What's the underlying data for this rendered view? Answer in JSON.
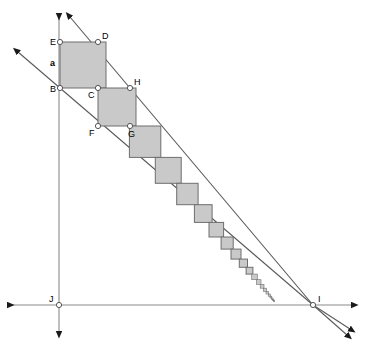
{
  "figure": {
    "canvas": {
      "width": 366,
      "height": 352
    },
    "colors": {
      "background": "#ffffff",
      "square_fill": "#c9c9c9",
      "square_stroke": "#6e6e6e",
      "line_stroke": "#5a5a5a",
      "axis_stroke": "#8a8a8a",
      "label_color": "#000000",
      "vertex_fill": "#ffffff",
      "vertex_stroke": "#555555"
    },
    "labels": {
      "a": "a",
      "B": "B",
      "C": "C",
      "D": "D",
      "E": "E",
      "F": "F",
      "G": "G",
      "H": "H",
      "I": "I",
      "J": "J"
    },
    "points": [
      {
        "name": "E",
        "x": 60,
        "y": 42,
        "label_dx": -10,
        "label_dy": 3
      },
      {
        "name": "D",
        "x": 98,
        "y": 42,
        "label_dx": 4,
        "label_dy": -3
      },
      {
        "name": "B",
        "x": 60,
        "y": 88,
        "label_dx": -10,
        "label_dy": 4
      },
      {
        "name": "C",
        "x": 98,
        "y": 88,
        "label_dx": -10,
        "label_dy": 10
      },
      {
        "name": "H",
        "x": 130,
        "y": 88,
        "label_dx": 4,
        "label_dy": -3
      },
      {
        "name": "F",
        "x": 98,
        "y": 126,
        "label_dx": -9,
        "label_dy": 10
      },
      {
        "name": "G",
        "x": 130,
        "y": 126,
        "label_dx": -2,
        "label_dy": 11
      },
      {
        "name": "J",
        "x": 59,
        "y": 305,
        "label_dx": -10,
        "label_dy": -3
      },
      {
        "name": "I",
        "x": 313,
        "y": 305,
        "label_dx": 5,
        "label_dy": -3
      }
    ],
    "squares": [
      {
        "x": 60.0,
        "y": 42.0,
        "size": 46.0
      },
      {
        "x": 98.0,
        "y": 88.0,
        "size": 38.0
      },
      {
        "x": 129.4,
        "y": 126.0,
        "size": 31.4
      },
      {
        "x": 155.3,
        "y": 157.4,
        "size": 25.9
      },
      {
        "x": 176.7,
        "y": 183.3,
        "size": 21.4
      },
      {
        "x": 194.4,
        "y": 204.7,
        "size": 17.7
      },
      {
        "x": 209.0,
        "y": 222.4,
        "size": 14.6
      },
      {
        "x": 221.1,
        "y": 237.0,
        "size": 12.1
      },
      {
        "x": 231.0,
        "y": 249.1,
        "size": 10.0
      },
      {
        "x": 239.3,
        "y": 259.1,
        "size": 8.2
      },
      {
        "x": 246.1,
        "y": 267.3,
        "size": 6.8
      },
      {
        "x": 251.7,
        "y": 274.1,
        "size": 5.6
      },
      {
        "x": 256.4,
        "y": 279.7,
        "size": 4.6
      },
      {
        "x": 260.2,
        "y": 284.4,
        "size": 3.8
      },
      {
        "x": 263.4,
        "y": 288.2,
        "size": 3.2
      },
      {
        "x": 266.0,
        "y": 291.4,
        "size": 2.6
      },
      {
        "x": 268.2,
        "y": 294.0,
        "size": 2.2
      },
      {
        "x": 270.0,
        "y": 296.2,
        "size": 1.8
      },
      {
        "x": 271.5,
        "y": 298.0,
        "size": 1.5
      },
      {
        "x": 272.7,
        "y": 299.5,
        "size": 1.2
      },
      {
        "x": 273.7,
        "y": 300.7,
        "size": 1.0
      }
    ],
    "rays": [
      {
        "name": "upper-ray",
        "from_x": 313,
        "from_y": 305,
        "to_x": 70,
        "to_y": 17,
        "arrow": "end"
      },
      {
        "name": "lower-ray",
        "from_x": 313,
        "from_y": 305,
        "to_x": 18,
        "to_y": 52,
        "arrow": "end"
      }
    ],
    "axes": [
      {
        "name": "vertical-axis",
        "x1": 59,
        "y1": 14,
        "x2": 59,
        "y2": 332,
        "arrow": "both"
      },
      {
        "name": "horizontal-axis",
        "x1": 8,
        "y1": 305,
        "x2": 352,
        "y2": 305,
        "arrow": "both"
      }
    ],
    "ray_extensions": [
      {
        "name": "upper-ray-extension",
        "x1": 313,
        "y1": 305,
        "x2": 350,
        "y2": 329
      },
      {
        "name": "lower-ray-extension",
        "x1": 313,
        "y1": 305,
        "x2": 347,
        "y2": 335
      }
    ]
  }
}
